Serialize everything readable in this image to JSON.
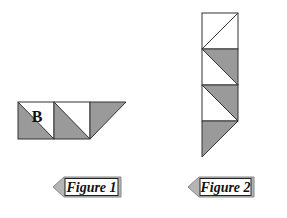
{
  "colors": {
    "shade": "#9a9a9a",
    "stroke": "#333333",
    "tag_fill": "#b5b5b5",
    "background": "#ffffff"
  },
  "figure1": {
    "label": "Figure 1",
    "cell_letter": "B",
    "cells": [
      {
        "diagonal": "tl-br",
        "shaded": "lower-left",
        "letter": "B"
      },
      {
        "diagonal": "tl-br",
        "shaded": "lower-left"
      },
      {
        "diagonal": "tr-bl",
        "shaded": "upper-left"
      }
    ]
  },
  "figure2": {
    "label": "Figure 2",
    "cells": [
      {
        "diagonal": "bl-tr",
        "shaded": "none"
      },
      {
        "diagonal": "tl-br",
        "shaded": "upper-right"
      },
      {
        "diagonal": "tl-br",
        "shaded": "upper-right"
      },
      {
        "diagonal": "tr-bl",
        "shaded": "upper-left"
      }
    ]
  }
}
